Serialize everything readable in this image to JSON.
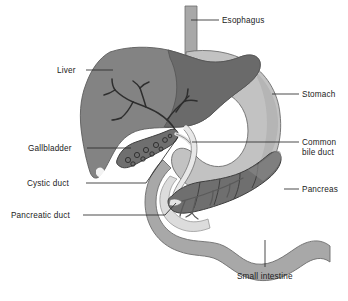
{
  "diagram": {
    "background_color": "#ffffff",
    "width": 348,
    "height": 301,
    "labels": [
      {
        "id": "esophagus",
        "text": "Esophagus",
        "x": 222,
        "y": 16,
        "align": "left"
      },
      {
        "id": "liver",
        "text": "Liver",
        "x": 57,
        "y": 66,
        "align": "left"
      },
      {
        "id": "stomach",
        "text": "Stomach",
        "x": 302,
        "y": 90,
        "align": "left"
      },
      {
        "id": "gallbladder",
        "text": "Gallbladder",
        "x": 28,
        "y": 144,
        "align": "left"
      },
      {
        "id": "common-bile-duct",
        "text": "Common bile duct",
        "x": 302,
        "y": 138,
        "align": "left",
        "two_line": true
      },
      {
        "id": "cystic-duct",
        "text": "Cystic duct",
        "x": 27,
        "y": 179,
        "align": "left"
      },
      {
        "id": "pancreas",
        "text": "Pancreas",
        "x": 302,
        "y": 185,
        "align": "left"
      },
      {
        "id": "pancreatic-duct",
        "text": "Pancreatic duct",
        "x": 11,
        "y": 211,
        "align": "left"
      },
      {
        "id": "small-intestine",
        "text": "Small intestine",
        "x": 237,
        "y": 272,
        "align": "left"
      }
    ],
    "organs": [
      {
        "id": "liver",
        "name": "Liver",
        "fill": "#838383"
      },
      {
        "id": "liver-lobe-dark",
        "name": "Liver right lobe overlap",
        "fill": "#6a6a6a"
      },
      {
        "id": "stomach",
        "name": "Stomach",
        "fill": "#c2c2c2"
      },
      {
        "id": "esophagus",
        "name": "Esophagus",
        "fill": "#a8a8a8"
      },
      {
        "id": "small-intestine",
        "name": "Small intestine duodenum",
        "fill": "#a8a8a8"
      },
      {
        "id": "duodenum-inner",
        "name": "Duodenal lumen",
        "fill": "#dcdcdc"
      },
      {
        "id": "pancreas",
        "name": "Pancreas",
        "fill": "#6f6f6f"
      },
      {
        "id": "gallbladder",
        "name": "Gallbladder",
        "fill": "#6f6f6f"
      },
      {
        "id": "bile-ducts",
        "name": "Intrahepatic bile ducts",
        "fill": "#3a3a3a"
      },
      {
        "id": "common-bile-duct",
        "name": "Common bile duct",
        "fill": "#e8e8e8"
      }
    ],
    "colors": {
      "outline": "#4a4a4a",
      "leader_line": "#2b2b2b",
      "text": "#1b1b1b"
    }
  }
}
